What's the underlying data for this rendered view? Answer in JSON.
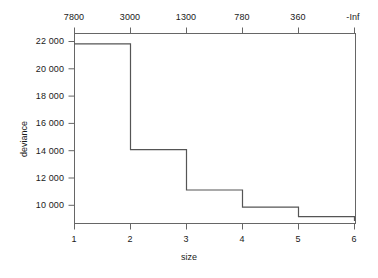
{
  "chart_data": {
    "type": "line",
    "subtype": "step",
    "title": "",
    "xlabel": "size",
    "ylabel": "deviance",
    "x": [
      1,
      2,
      3,
      4,
      5,
      6
    ],
    "values": [
      22050,
      14300,
      11350,
      10100,
      9400,
      9400
    ],
    "categories": [
      "1",
      "2",
      "3",
      "4",
      "5",
      "6"
    ],
    "series": [
      {
        "name": "deviance",
        "values": [
          22050,
          14300,
          11350,
          10100,
          9400,
          9400
        ]
      }
    ],
    "xlim": [
      0.75,
      6.25
    ],
    "ylim": [
      8900,
      22800
    ],
    "grid": false,
    "legend": null,
    "legend_position": "none",
    "x_ticks": [
      1,
      2,
      3,
      4,
      5,
      6
    ],
    "x_tick_labels": [
      "1",
      "2",
      "3",
      "4",
      "5",
      "6"
    ],
    "y_ticks": [
      10000,
      12000,
      14000,
      16000,
      18000,
      20000,
      22000
    ],
    "y_tick_labels": [
      "10 000",
      "12 000",
      "14 000",
      "16 000",
      "18 000",
      "20 000",
      "22 000"
    ],
    "secondary_x_axis": {
      "position": "top",
      "label": "",
      "ticks": [
        1,
        2,
        3,
        4,
        5,
        6
      ],
      "tick_labels": [
        "7800",
        "3000",
        "1300",
        "780",
        "360",
        "-Inf"
      ]
    },
    "line_color": "#555555",
    "background_color": "#ffffff",
    "axis_color": "#666666"
  }
}
